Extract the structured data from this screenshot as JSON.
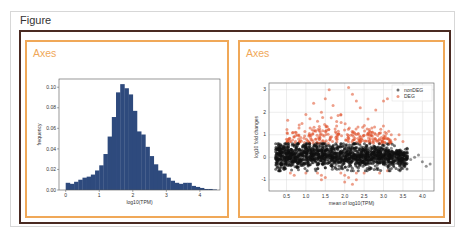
{
  "figure": {
    "title": "Figure",
    "colors": {
      "figure_border": "#d7d7d7",
      "inner_border": "#4a2a22",
      "axes_border": "#f0a858",
      "axes_label": "#f0a858"
    }
  },
  "axes": [
    {
      "label": "Axes"
    },
    {
      "label": "Axes"
    }
  ],
  "chart_data": [
    {
      "type": "bar",
      "subtype": "histogram",
      "title": "",
      "xlabel": "log10(TPM)",
      "ylabel": "frequency",
      "bin_start": 0.0,
      "bin_width": 0.125,
      "values": [
        0.007,
        0.006,
        0.008,
        0.01,
        0.012,
        0.013,
        0.015,
        0.019,
        0.024,
        0.035,
        0.052,
        0.071,
        0.095,
        0.103,
        0.099,
        0.093,
        0.077,
        0.057,
        0.054,
        0.042,
        0.033,
        0.025,
        0.019,
        0.016,
        0.012,
        0.009,
        0.007,
        0.006,
        0.007,
        0.007,
        0.004,
        0.003,
        0.002,
        0.001,
        0.001,
        0.0005
      ],
      "xticks": [
        "0",
        "1",
        "2",
        "3",
        "4"
      ],
      "yticks": [
        "0.00",
        "0.02",
        "0.04",
        "0.06",
        "0.08",
        "0.10"
      ],
      "xlim": [
        -0.2,
        4.6
      ],
      "ylim": [
        0,
        0.108
      ],
      "grid": false,
      "bar_color": "#2e4a7d"
    },
    {
      "type": "scatter",
      "title": "",
      "xlabel": "mean of log10(TPM)",
      "ylabel": "log10 fold changes",
      "xticks": [
        "0.5",
        "1.0",
        "1.5",
        "2.0",
        "2.5",
        "3.0",
        "3.5",
        "4.0"
      ],
      "yticks": [
        "-1",
        "0",
        "1",
        "2",
        "3"
      ],
      "xlim": [
        0.05,
        4.3
      ],
      "ylim": [
        -1.5,
        3.3
      ],
      "grid": true,
      "legend": {
        "position": "upper right",
        "entries": [
          "nonDEG",
          "DEG"
        ]
      },
      "series": [
        {
          "name": "nonDEG",
          "color": "#111111",
          "description": "dense cloud, x 0.2-4.2, y approx -0.6 to 0.6, spread narrowing at high x",
          "outliers": [
            [
              3.7,
              -0.1
            ],
            [
              3.8,
              0.0
            ],
            [
              4.0,
              -0.2
            ],
            [
              4.1,
              -0.4
            ],
            [
              4.2,
              -0.3
            ],
            [
              3.9,
              0.1
            ],
            [
              3.6,
              0.2
            ],
            [
              3.4,
              0.3
            ],
            [
              3.2,
              0.4
            ],
            [
              3.5,
              -0.5
            ]
          ]
        },
        {
          "name": "DEG",
          "color": "#e0502a",
          "description": "points with |fold change| above threshold, mostly 0.6-2.0, x 0.3-3.6",
          "points": [
            [
              2.1,
              3.1
            ],
            [
              1.6,
              3.0
            ],
            [
              2.2,
              2.8
            ],
            [
              1.5,
              2.6
            ],
            [
              1.2,
              2.4
            ],
            [
              1.7,
              2.3
            ],
            [
              2.4,
              2.2
            ],
            [
              3.0,
              2.5
            ],
            [
              3.1,
              2.6
            ],
            [
              2.8,
              2.1
            ],
            [
              2.3,
              2.5
            ],
            [
              1.4,
              2.0
            ],
            [
              1.9,
              1.9
            ],
            [
              1.0,
              1.9
            ],
            [
              2.6,
              1.7
            ],
            [
              0.9,
              1.5
            ],
            [
              1.3,
              1.6
            ],
            [
              2.7,
              1.3
            ],
            [
              3.2,
              1.0
            ],
            [
              3.4,
              1.0
            ],
            [
              3.3,
              0.8
            ],
            [
              0.5,
              0.8
            ],
            [
              0.7,
              0.9
            ],
            [
              3.5,
              0.7
            ],
            [
              0.6,
              -0.7
            ],
            [
              0.7,
              -0.8
            ],
            [
              1.3,
              -0.7
            ],
            [
              1.4,
              -0.8
            ],
            [
              1.5,
              -0.9
            ],
            [
              1.9,
              -0.7
            ],
            [
              2.0,
              -0.8
            ],
            [
              2.1,
              -0.9
            ],
            [
              2.3,
              -0.7
            ],
            [
              2.5,
              -0.7
            ],
            [
              2.9,
              -0.7
            ],
            [
              3.1,
              -0.6
            ],
            [
              2.0,
              -1.1
            ],
            [
              2.2,
              -1.2
            ],
            [
              2.3,
              -1.0
            ],
            [
              1.4,
              -1.0
            ],
            [
              1.0,
              -0.7
            ]
          ]
        }
      ]
    }
  ]
}
